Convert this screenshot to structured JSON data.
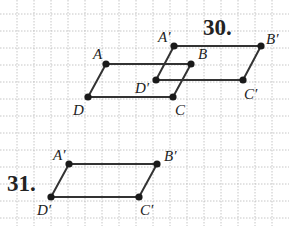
{
  "figure": {
    "grid": {
      "spacing": 17,
      "origin_x": 0,
      "origin_y": 14,
      "color": "#b8b8b8"
    },
    "colors": {
      "stroke": "#333333",
      "point": "#1a1a1a",
      "text": "#222222"
    },
    "problems": [
      {
        "number": "30.",
        "number_pos": [
          203,
          35
        ],
        "shapes": [
          {
            "name": "original",
            "vertices": [
              {
                "label": "A",
                "x": 106,
                "y": 64,
                "lx": 93,
                "ly": 59
              },
              {
                "label": "B",
                "x": 191,
                "y": 64,
                "lx": 198,
                "ly": 59
              },
              {
                "label": "C",
                "x": 173,
                "y": 97,
                "lx": 175,
                "ly": 115
              },
              {
                "label": "D",
                "x": 88,
                "y": 97,
                "lx": 73,
                "ly": 115
              }
            ]
          },
          {
            "name": "image",
            "vertices": [
              {
                "label": "A′",
                "x": 174,
                "y": 46,
                "lx": 158,
                "ly": 42
              },
              {
                "label": "B′",
                "x": 261,
                "y": 46,
                "lx": 266,
                "ly": 44
              },
              {
                "label": "C′",
                "x": 243,
                "y": 80,
                "lx": 244,
                "ly": 99
              },
              {
                "label": "D′",
                "x": 156,
                "y": 80,
                "lx": 135,
                "ly": 93
              }
            ]
          }
        ]
      },
      {
        "number": "31.",
        "number_pos": [
          7,
          191
        ],
        "shapes": [
          {
            "name": "image",
            "vertices": [
              {
                "label": "A′",
                "x": 69,
                "y": 164,
                "lx": 53,
                "ly": 160
              },
              {
                "label": "B′",
                "x": 157,
                "y": 164,
                "lx": 164,
                "ly": 161
              },
              {
                "label": "C′",
                "x": 139,
                "y": 197,
                "lx": 140,
                "ly": 215
              },
              {
                "label": "D′",
                "x": 51,
                "y": 197,
                "lx": 37,
                "ly": 215
              }
            ]
          }
        ]
      }
    ]
  }
}
